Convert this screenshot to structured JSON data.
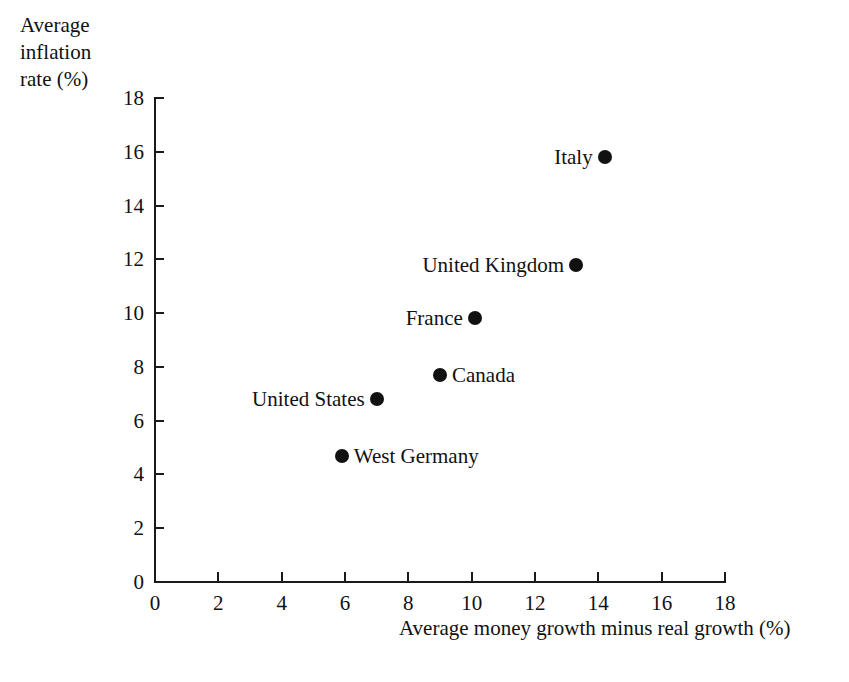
{
  "chart_data": {
    "type": "scatter",
    "title": "",
    "xlabel": "Average money growth minus real growth (%)",
    "ylabel": "Average inflation rate (%)",
    "ylabel_lines": [
      "Average",
      "inflation",
      "rate (%)"
    ],
    "xlim": [
      0,
      18
    ],
    "ylim": [
      0,
      18
    ],
    "xticks": [
      0,
      2,
      4,
      6,
      8,
      10,
      12,
      14,
      16,
      18
    ],
    "yticks": [
      0,
      2,
      4,
      6,
      8,
      10,
      12,
      14,
      16,
      18
    ],
    "xtick_labels": [
      "0",
      "2",
      "4",
      "6",
      "8",
      "10",
      "12",
      "14",
      "16",
      "18"
    ],
    "ytick_labels": [
      "0",
      "2",
      "4",
      "6",
      "8",
      "10",
      "12",
      "14",
      "16",
      "18"
    ],
    "grid": false,
    "legend": false,
    "marker_color": "#111111",
    "axis_color": "#1a1a1a",
    "background": "#ffffff",
    "points": [
      {
        "label": "Italy",
        "x": 14.2,
        "y": 15.8,
        "label_side": "left"
      },
      {
        "label": "United Kingdom",
        "x": 13.3,
        "y": 11.8,
        "label_side": "left"
      },
      {
        "label": "France",
        "x": 10.1,
        "y": 9.8,
        "label_side": "left"
      },
      {
        "label": "Canada",
        "x": 9.0,
        "y": 7.7,
        "label_side": "right"
      },
      {
        "label": "United States",
        "x": 7.0,
        "y": 6.8,
        "label_side": "left"
      },
      {
        "label": "West Germany",
        "x": 5.9,
        "y": 4.7,
        "label_side": "right"
      }
    ]
  }
}
